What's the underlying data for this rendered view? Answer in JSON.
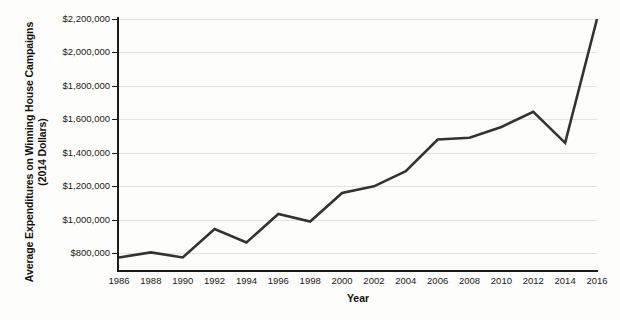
{
  "chart_data": {
    "type": "line",
    "title": "",
    "xlabel": "Year",
    "ylabel": "Average Expenditures on Winning House Campaigns (2014 Dollars)",
    "ylabel_line1": "Average Expenditures on Winning House Campaigns",
    "ylabel_line2": "(2014 Dollars)",
    "grid": true,
    "legend": false,
    "xlim": [
      1986,
      2016
    ],
    "ylim": [
      700000,
      2200000
    ],
    "ytick_values": [
      800000,
      1000000,
      1200000,
      1400000,
      1600000,
      1800000,
      2000000,
      2200000
    ],
    "ytick_labels": [
      "$800,000",
      "$1,000,000",
      "$1,200,000",
      "$1,400,000",
      "$1,600,000",
      "$1,800,000",
      "$2,000,000",
      "$2,200,000"
    ],
    "x": [
      1986,
      1988,
      1990,
      1992,
      1994,
      1996,
      1998,
      2000,
      2002,
      2004,
      2006,
      2008,
      2010,
      2012,
      2014,
      2016
    ],
    "categories": [
      "1986",
      "1988",
      "1990",
      "1992",
      "1994",
      "1996",
      "1998",
      "2000",
      "2002",
      "2004",
      "2006",
      "2008",
      "2010",
      "2012",
      "2014",
      "2016"
    ],
    "values": [
      775000,
      805000,
      775000,
      945000,
      865000,
      1035000,
      990000,
      1160000,
      1200000,
      1290000,
      1480000,
      1490000,
      1555000,
      1645000,
      1460000,
      2200000
    ],
    "series": [
      {
        "name": "Average Expenditures on Winning House Campaigns",
        "color": "#333333",
        "values": [
          775000,
          805000,
          775000,
          945000,
          865000,
          1035000,
          990000,
          1160000,
          1200000,
          1290000,
          1480000,
          1490000,
          1555000,
          1645000,
          1460000,
          2200000
        ]
      }
    ],
    "colors": {
      "line": "#333333",
      "grid": "#e3e3e3",
      "axis": "#1a1a1a",
      "background": "#fdfdfb",
      "text": "#111111"
    }
  }
}
